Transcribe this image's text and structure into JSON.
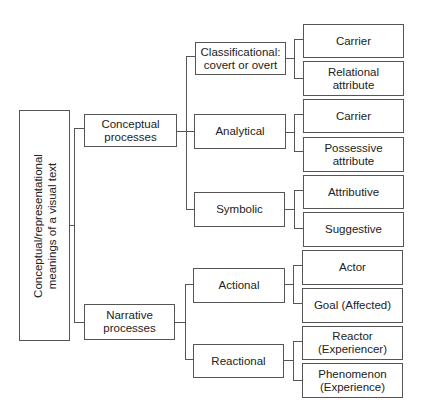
{
  "root": {
    "line1": "Conceptual/representational",
    "line2": "meanings of a visual text"
  },
  "level1": [
    {
      "label": "Conceptual\nprocesses"
    },
    {
      "label": "Narrative\nprocesses"
    }
  ],
  "level2": [
    {
      "label": "Classificational:\ncovert or overt"
    },
    {
      "label": "Analytical"
    },
    {
      "label": "Symbolic"
    },
    {
      "label": "Actional"
    },
    {
      "label": "Reactional"
    }
  ],
  "level3": [
    {
      "label": "Carrier"
    },
    {
      "label": "Relational\nattribute"
    },
    {
      "label": "Carrier"
    },
    {
      "label": "Possessive\nattribute"
    },
    {
      "label": "Attributive"
    },
    {
      "label": "Suggestive"
    },
    {
      "label": "Actor"
    },
    {
      "label": "Goal (Affected)"
    },
    {
      "label": "Reactor\n(Experiencer)"
    },
    {
      "label": "Phenomenon\n(Experience)"
    }
  ]
}
